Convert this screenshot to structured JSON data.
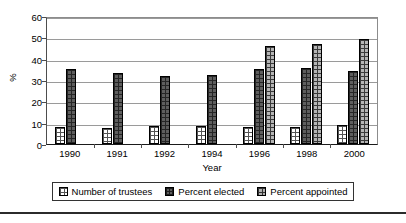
{
  "chart_data": {
    "type": "bar",
    "title": "",
    "xlabel": "Year",
    "ylabel": "%",
    "ylim": [
      0,
      60
    ],
    "ytick_step": 10,
    "yticks": [
      60,
      50,
      40,
      30,
      20,
      10,
      0
    ],
    "grid": "horizontal",
    "legend_position": "bottom",
    "categories": [
      "1990",
      "1991",
      "1992",
      "1994",
      "1996",
      "1998",
      "2000"
    ],
    "series": [
      {
        "name": "Number of trustees",
        "key": "trustees",
        "values": [
          8,
          7.5,
          8.5,
          8.5,
          8,
          8,
          9
        ]
      },
      {
        "name": "Percent elected",
        "key": "elected",
        "values": [
          35,
          33.5,
          32,
          32.5,
          35,
          35.5,
          34
        ]
      },
      {
        "name": "Percent appointed",
        "key": "appointed",
        "values": [
          null,
          null,
          null,
          null,
          46,
          47,
          49
        ]
      }
    ]
  },
  "axes": {
    "y_title": "%",
    "x_title": "Year"
  },
  "legend": {
    "entries": [
      {
        "label": "Number of trustees",
        "key": "trustees"
      },
      {
        "label": "Percent elected",
        "key": "elected"
      },
      {
        "label": "Percent appointed",
        "key": "appointed"
      }
    ]
  },
  "colors": {
    "trustees": "#ffffff",
    "elected": "#5e5e5e",
    "appointed": "#b5b5b5",
    "axis": "#1a1a1a",
    "grid": "#9a9a9a",
    "text": "#000000"
  }
}
